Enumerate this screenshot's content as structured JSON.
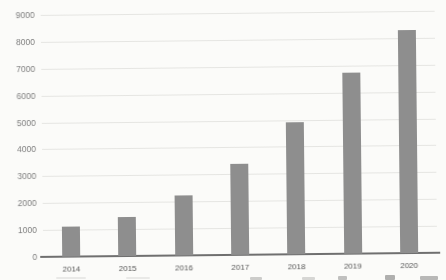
{
  "chart_data": {
    "type": "bar",
    "title": "",
    "subtitle": "",
    "xlabel": "",
    "ylabel": "",
    "categories": [
      "2014",
      "2015",
      "2016",
      "2017",
      "2018",
      "2019",
      "2020"
    ],
    "values": [
      1100,
      1450,
      2250,
      3400,
      4900,
      6750,
      8300
    ],
    "series_name": "",
    "ylim": [
      0,
      9000
    ],
    "ytick_interval": 1000,
    "yticks": [
      "0",
      "1000",
      "2000",
      "3000",
      "4000",
      "5000",
      "6000",
      "7000",
      "8000",
      "9000"
    ],
    "grid": true,
    "legend_visible": false,
    "colors": {
      "bar": "#8e8e8e",
      "gridline": "#e5e5e2",
      "axis_line": "#6f6f6f",
      "y_tick_label": "#7e7e7e",
      "x_tick_label": "#565656",
      "background": "#fbfbf9"
    }
  }
}
